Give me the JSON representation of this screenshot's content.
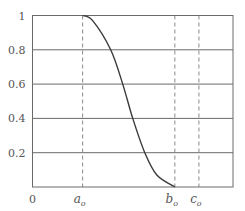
{
  "chart_data": {
    "type": "line",
    "title": "",
    "xlabel": "",
    "ylabel": "",
    "grid": true,
    "legend": null,
    "ylim": [
      0,
      1
    ],
    "xlim": [
      0,
      1
    ],
    "y_ticks": [
      {
        "value": 0.2,
        "label": "0.2"
      },
      {
        "value": 0.4,
        "label": "0.4"
      },
      {
        "value": 0.6,
        "label": "0.6"
      },
      {
        "value": 0.8,
        "label": "0.8"
      },
      {
        "value": 1.0,
        "label": "1"
      }
    ],
    "origin_label": "0",
    "x_markers": [
      {
        "name": "a",
        "subscript": "o",
        "x": 0.25,
        "style": "dashed"
      },
      {
        "name": "b",
        "subscript": "o",
        "x": 0.71,
        "style": "dashed"
      },
      {
        "name": "c",
        "subscript": "o",
        "x": 0.83,
        "style": "dashed"
      }
    ],
    "series": [
      {
        "name": "membership",
        "description": "Smooth S-shaped decreasing curve from 1 at a_o to 0 at b_o",
        "points": [
          {
            "x": 0.25,
            "y": 1.0
          },
          {
            "x": 0.3,
            "y": 0.97
          },
          {
            "x": 0.39,
            "y": 0.8
          },
          {
            "x": 0.45,
            "y": 0.6
          },
          {
            "x": 0.5,
            "y": 0.4
          },
          {
            "x": 0.56,
            "y": 0.2
          },
          {
            "x": 0.62,
            "y": 0.07
          },
          {
            "x": 0.71,
            "y": 0.0
          }
        ]
      }
    ]
  },
  "colors": {
    "axis": "#6a6a6a",
    "grid": "#6a6a6a",
    "curve": "#3a3a3a",
    "dashed": "#8a8a8a",
    "label": "#555555"
  }
}
